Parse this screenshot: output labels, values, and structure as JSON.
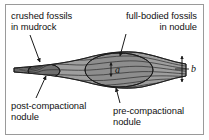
{
  "figure": {
    "background_color": "#ffffff",
    "border_color": "#9a9a9a",
    "width": 209,
    "height": 140
  },
  "labels": {
    "crushed_fossils": "crushed fossils\nin mudrock",
    "full_bodied_fossils": "full-bodied fossils\nin nodule",
    "post_compactional_nodule": "post-compactional\nnodule",
    "pre_compactional_nodule": "pre-compactional\nnodule"
  },
  "dimensions": {
    "a": "a",
    "b": "b"
  },
  "colors": {
    "mudrock_fill": "#9e9e9e",
    "nodule_fill": "#8a8a8a",
    "post_nodule_fill": "#6f6f6f",
    "lamination_line": "#2e2e2e",
    "outline": "#1a1a1a",
    "leader_line": "#1a1a1a",
    "text": "#111111"
  }
}
